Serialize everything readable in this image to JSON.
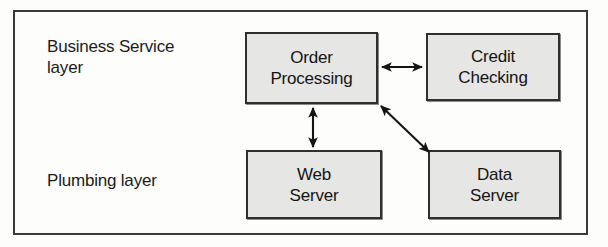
{
  "diagram": {
    "frame": {
      "border_color": "#3a3a3a"
    },
    "layers": [
      {
        "id": "business-service",
        "label": "Business Service\nlayer"
      },
      {
        "id": "plumbing",
        "label": "Plumbing layer"
      }
    ],
    "nodes": [
      {
        "id": "order-processing",
        "label": "Order\nProcessing",
        "layer": "business-service",
        "fill": "#e6e6e4",
        "border": "#2f2f2f"
      },
      {
        "id": "credit-checking",
        "label": "Credit\nChecking",
        "layer": "business-service",
        "fill": "#e6e6e4",
        "border": "#2f2f2f"
      },
      {
        "id": "web-server",
        "label": "Web\nServer",
        "layer": "plumbing",
        "fill": "#e6e6e4",
        "border": "#2f2f2f"
      },
      {
        "id": "data-server",
        "label": "Data\nServer",
        "layer": "plumbing",
        "fill": "#e6e6e4",
        "border": "#2f2f2f"
      }
    ],
    "connectors": [
      {
        "id": "order-processing--credit-checking",
        "from": "order-processing",
        "to": "credit-checking",
        "style": "double-arrow",
        "orientation": "horizontal"
      },
      {
        "id": "order-processing--web-server",
        "from": "order-processing",
        "to": "web-server",
        "style": "double-arrow",
        "orientation": "vertical"
      },
      {
        "id": "order-processing--data-server",
        "from": "order-processing",
        "to": "data-server",
        "style": "double-arrow",
        "orientation": "diagonal"
      }
    ]
  }
}
